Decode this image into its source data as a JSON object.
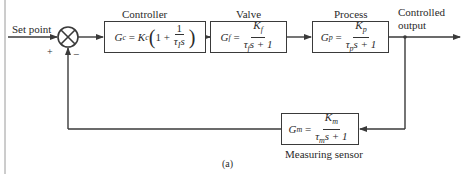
{
  "diagram": {
    "caption": "(a)",
    "input": {
      "label": "Set point",
      "plus_sign": "+",
      "minus_sign": "−"
    },
    "output": {
      "label_line1": "Controlled",
      "label_line2": "output"
    },
    "blocks": [
      {
        "id": "controller",
        "title": "Controller",
        "lhs": "G",
        "lhs_sub": "c",
        "eq": "=",
        "gain": "K",
        "gain_sub": "c",
        "open": "(1 +",
        "num": "1",
        "den_tau": "τ",
        "den_sub": "I",
        "den_rest": "s",
        "close": ")"
      },
      {
        "id": "valve",
        "title": "Valve",
        "lhs": "G",
        "lhs_sub": "f",
        "eq": "=",
        "num": "K",
        "num_sub": "f",
        "den_tau": "τ",
        "den_sub": "f",
        "den_rest": "s + 1"
      },
      {
        "id": "process",
        "title": "Process",
        "lhs": "G",
        "lhs_sub": "p",
        "eq": "=",
        "num": "K",
        "num_sub": "p",
        "den_tau": "τ",
        "den_sub": "p",
        "den_rest": "s + 1"
      },
      {
        "id": "measuring",
        "title": "Measuring sensor",
        "lhs": "G",
        "lhs_sub": "m",
        "eq": "=",
        "num": "K",
        "num_sub": "m",
        "den_tau": "τ",
        "den_sub": "m",
        "den_rest": "s + 1"
      }
    ],
    "colors": {
      "line": "#3a3a3a",
      "background": "#ffffff"
    }
  }
}
